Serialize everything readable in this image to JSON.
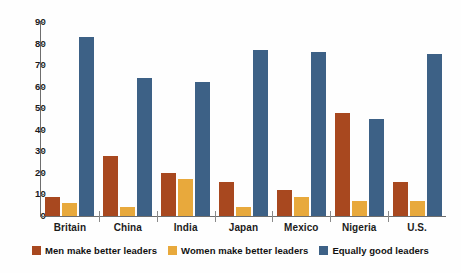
{
  "chart_data": {
    "type": "bar",
    "title": "",
    "subtitle": "",
    "xlabel": "",
    "ylabel": "",
    "ylim": [
      0,
      90
    ],
    "ytick_step": 10,
    "yticks": [
      90,
      80,
      70,
      60,
      50,
      40,
      30,
      20,
      10,
      0
    ],
    "grid": false,
    "legend_position": "bottom",
    "categories": [
      "Britain",
      "China",
      "India",
      "Japan",
      "Mexico",
      "Nigeria",
      "U.S."
    ],
    "series": [
      {
        "name": "Men make better leaders",
        "color": "#a8481f",
        "values": [
          9,
          28,
          20,
          16,
          12,
          48,
          16
        ]
      },
      {
        "name": "Women make better leaders",
        "color": "#e8a93c",
        "values": [
          6,
          4,
          17,
          4,
          9,
          7,
          7
        ]
      },
      {
        "name": "Equally good leaders",
        "color": "#3d6186",
        "values": [
          83,
          64,
          62,
          77,
          76,
          45,
          75
        ]
      }
    ]
  },
  "legend": {
    "items": [
      {
        "label": "Men make better leaders",
        "color": "#a8481f",
        "icon": "legend-swatch-men"
      },
      {
        "label": "Women make better leaders",
        "color": "#e8a93c",
        "icon": "legend-swatch-women"
      },
      {
        "label": "Equally good leaders",
        "color": "#3d6186",
        "icon": "legend-swatch-equal"
      }
    ]
  }
}
